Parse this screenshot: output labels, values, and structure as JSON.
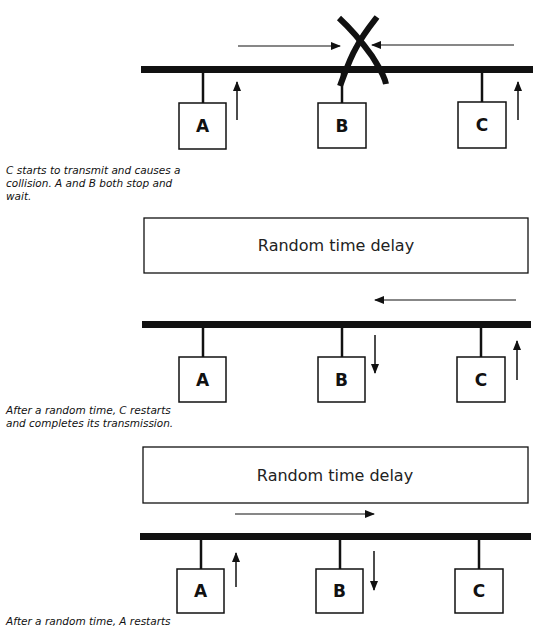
{
  "panels": [
    {
      "nodes": [
        {
          "label": "A"
        },
        {
          "label": "B"
        },
        {
          "label": "C"
        }
      ],
      "caption": "C starts to transmit and causes a\ncollision. A and B both stop and\nwait.",
      "event": "collision"
    },
    {
      "delay_label": "Random time delay",
      "nodes": [
        {
          "label": "A"
        },
        {
          "label": "B"
        },
        {
          "label": "C"
        }
      ],
      "caption": "After a random time, C restarts\nand completes its transmission.",
      "signal_direction": "right-to-left"
    },
    {
      "delay_label": "Random time delay",
      "nodes": [
        {
          "label": "A"
        },
        {
          "label": "B"
        },
        {
          "label": "C"
        }
      ],
      "caption": "After a random time, A restarts",
      "signal_direction": "left-to-right"
    }
  ],
  "colors": {
    "ink": "#111111",
    "background": "#ffffff"
  }
}
